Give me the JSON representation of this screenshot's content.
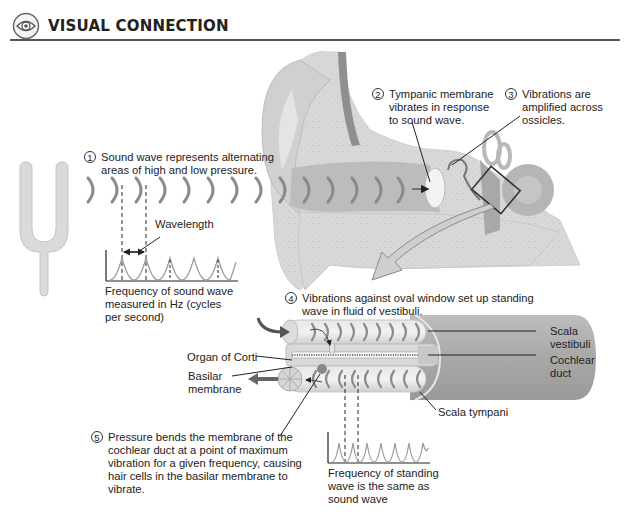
{
  "header": {
    "icon": "eye-icon",
    "title": "VISUAL CONNECTION"
  },
  "steps": [
    {
      "number": "1",
      "text_lines": [
        "Sound wave represents alternating",
        "areas of high and low pressure."
      ]
    },
    {
      "number": "2",
      "text_lines": [
        "Tympanic membrane",
        "vibrates in response",
        "to sound wave."
      ]
    },
    {
      "number": "3",
      "text_lines": [
        "Vibrations are",
        "amplified across",
        "ossicles."
      ]
    },
    {
      "number": "4",
      "text_lines": [
        "Vibrations against oval window set up standing",
        "wave in fluid of vestibuli."
      ]
    },
    {
      "number": "5",
      "text_lines": [
        "Pressure bends the membrane of the",
        "cochlear duct at a point of maximum",
        "vibration for a given frequency, causing",
        "hair cells in the basilar membrane to",
        "vibrate."
      ]
    }
  ],
  "labels": {
    "wavelength": "Wavelength",
    "frequency_sound": [
      "Frequency of sound wave",
      "measured in Hz (cycles",
      "per second)"
    ],
    "frequency_standing": [
      "Frequency of standing",
      "wave is the same as",
      "sound wave"
    ],
    "organ_of_corti": "Organ of Corti",
    "basilar_membrane": [
      "Basilar",
      "membrane"
    ],
    "scala_vestibuli": [
      "Scala",
      "vestibuli"
    ],
    "cochlear_duct": [
      "Cochlear",
      "duct"
    ],
    "scala_tympani": "Scala tympani"
  },
  "colors": {
    "header_rule": "#555555",
    "tissue_light": "#e2e2e2",
    "tissue_mid": "#c8c8c8",
    "tissue_dark": "#9a9a9a",
    "wave_arc": "#8a8a8a",
    "text": "#222222"
  }
}
